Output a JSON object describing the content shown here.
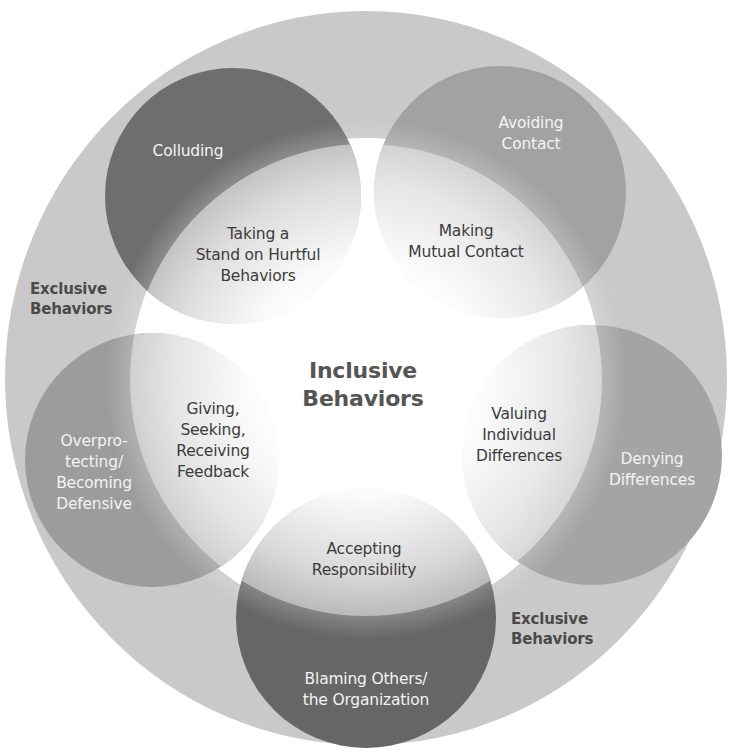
{
  "diagram": {
    "center_label": "Inclusive\nBehaviors",
    "exclusive_labels": [
      "Exclusive\nBehaviors",
      "Exclusive\nBehaviors"
    ],
    "petals": [
      {
        "outer": "Colluding",
        "inner": "Taking a\nStand on Hurtful\nBehaviors"
      },
      {
        "outer": "Avoiding\nContact",
        "inner": "Making\nMutual Contact"
      },
      {
        "outer": "Denying\nDifferences",
        "inner": "Valuing\nIndividual\nDifferences"
      },
      {
        "outer": "Blaming Others/\nthe Organization",
        "inner": "Accepting\nResponsibility"
      },
      {
        "outer": "Overpro-\ntecting/\nBecoming\nDefensive",
        "inner": "Giving,\nSeeking,\nReceiving\nFeedback"
      }
    ]
  },
  "colors": {
    "outer_ring": "#c9c9c9",
    "colluding": "#6e6e6e",
    "avoiding": "#a2a2a2",
    "denying": "#a4a4a4",
    "blaming": "#666666",
    "overprotecting": "#9c9c9c",
    "center": "#ffffff"
  }
}
